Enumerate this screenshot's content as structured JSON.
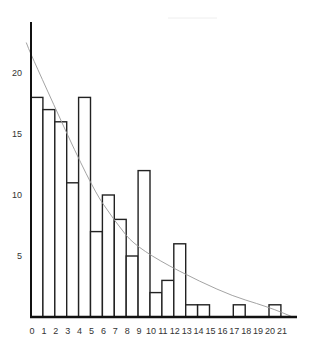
{
  "chart_data": {
    "type": "bar",
    "title": "",
    "xlabel": "",
    "ylabel": "",
    "x_tick_labels": [
      "0",
      "1",
      "2",
      "3",
      "4",
      "5",
      "6",
      "7",
      "8",
      "9",
      "10",
      "11",
      "12",
      "13",
      "14",
      "15",
      "16",
      "17",
      "18",
      "19",
      "20",
      "21"
    ],
    "y_tick_labels": [
      "5",
      "10",
      "15",
      "20"
    ],
    "ylim": [
      0,
      24
    ],
    "xlim": [
      0,
      22
    ],
    "grid": false,
    "legend": null,
    "bins": [
      {
        "start": 0,
        "end": 1,
        "value": 18
      },
      {
        "start": 1,
        "end": 2,
        "value": 17
      },
      {
        "start": 2,
        "end": 3,
        "value": 16
      },
      {
        "start": 3,
        "end": 4,
        "value": 11
      },
      {
        "start": 4,
        "end": 5,
        "value": 18
      },
      {
        "start": 5,
        "end": 6,
        "value": 7
      },
      {
        "start": 6,
        "end": 7,
        "value": 10
      },
      {
        "start": 7,
        "end": 8,
        "value": 8
      },
      {
        "start": 8,
        "end": 9,
        "value": 5
      },
      {
        "start": 9,
        "end": 10,
        "value": 12
      },
      {
        "start": 10,
        "end": 11,
        "value": 2
      },
      {
        "start": 11,
        "end": 12,
        "value": 3
      },
      {
        "start": 12,
        "end": 13,
        "value": 6
      },
      {
        "start": 13,
        "end": 14,
        "value": 1
      },
      {
        "start": 14,
        "end": 15,
        "value": 1
      },
      {
        "start": 17,
        "end": 18,
        "value": 1
      },
      {
        "start": 20,
        "end": 21,
        "value": 1
      }
    ],
    "trend_curve": {
      "type": "exponential-decay",
      "color": "#999999",
      "points": [
        [
          -0.4,
          22.5
        ],
        [
          0,
          21.5
        ],
        [
          5,
          10.8
        ],
        [
          7,
          7.9
        ],
        [
          9,
          5.5
        ],
        [
          16,
          2.0
        ],
        [
          20,
          0.8
        ],
        [
          22,
          0
        ]
      ]
    },
    "colors": {
      "bar_fill": "#ffffff",
      "bar_stroke": "#222222",
      "axis": "#111111",
      "curve": "#999999"
    }
  }
}
